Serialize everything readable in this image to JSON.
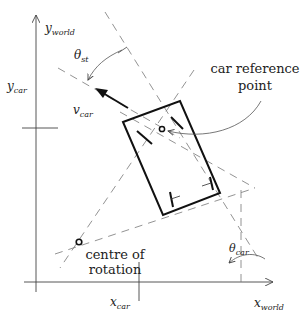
{
  "labels": {
    "y_world": {
      "main": "y",
      "sub": "world"
    },
    "x_world": {
      "main": "x",
      "sub": "world"
    },
    "y_car": {
      "main": "y",
      "sub": "car"
    },
    "x_car": {
      "main": "x",
      "sub": "car"
    },
    "v_car": {
      "main": "v",
      "sub": "car"
    },
    "theta_st": {
      "main": "θ",
      "sub": "st"
    },
    "theta_car": {
      "main": "θ",
      "sub": "car"
    },
    "car_reference_point": [
      "car reference",
      "point"
    ],
    "centre_of_rotation": [
      "centre of",
      "rotation"
    ]
  },
  "colors": {
    "line": "#111111",
    "dashed": "#777777",
    "thin": "#444444"
  }
}
